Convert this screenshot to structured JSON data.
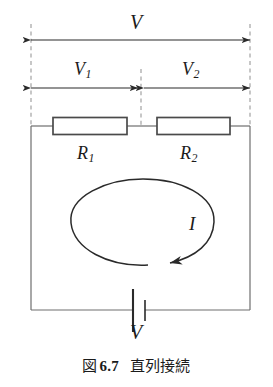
{
  "figure": {
    "caption_prefix": "図",
    "caption_number": "6.7",
    "caption_title": "直列接続",
    "line_color": "#2a2a2a",
    "dash_color": "#9a9a9a",
    "background": "#ffffff"
  },
  "labels": {
    "total_voltage": "V",
    "voltage_1": "V",
    "voltage_1_sub": "1",
    "voltage_2": "V",
    "voltage_2_sub": "2",
    "resistor_1": "R",
    "resistor_1_sub": "1",
    "resistor_2": "R",
    "resistor_2_sub": "2",
    "current": "I",
    "source_voltage": "V"
  },
  "components": {
    "resistor_1_name": "resistor-r1",
    "resistor_2_name": "resistor-r2",
    "battery_name": "battery-source",
    "current_loop_name": "current-direction-loop"
  }
}
